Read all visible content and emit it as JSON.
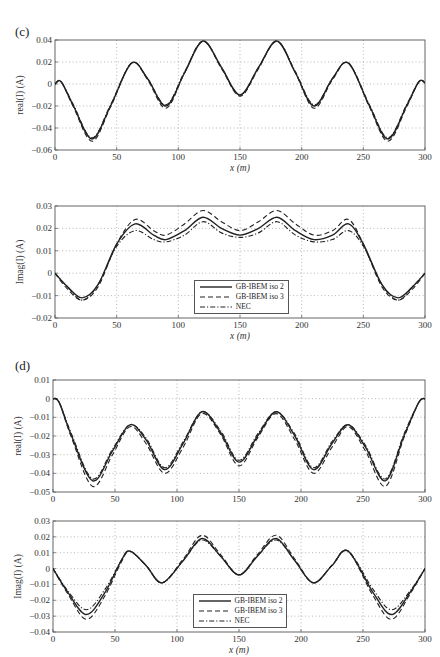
{
  "panels": [
    {
      "label": "(c)"
    },
    {
      "label": "(d)"
    }
  ],
  "legend": {
    "entries": [
      {
        "name": "GB-IBEM iso 2",
        "style": "solid"
      },
      {
        "name": "GB-IBEM iso 3",
        "style": "dashed"
      },
      {
        "name": "NEC",
        "style": "dashdot"
      }
    ]
  },
  "chart_data": [
    {
      "panel": "(c)",
      "type": "line",
      "title": "",
      "xlabel": "x (m)",
      "ylabel": "real(I) (A)",
      "xlim": [
        0,
        300
      ],
      "ylim": [
        -0.06,
        0.04
      ],
      "xticks": [
        "0",
        "50",
        "100",
        "150",
        "200",
        "250",
        "300"
      ],
      "yticks": [
        "0.04",
        "0.02",
        "0",
        "-0.02",
        "-0.04",
        "-0.06"
      ],
      "grid": true,
      "legend_position": "none",
      "x": [
        0,
        5,
        15,
        30,
        45,
        62,
        75,
        90,
        105,
        120,
        135,
        150,
        165,
        180,
        195,
        210,
        225,
        238,
        255,
        270,
        285,
        295,
        300
      ],
      "series": [
        {
          "name": "GB-IBEM iso 2",
          "values": [
            0,
            0.002,
            -0.02,
            -0.05,
            -0.02,
            0.019,
            0.005,
            -0.02,
            0.01,
            0.039,
            0.015,
            -0.01,
            0.015,
            0.039,
            0.01,
            -0.02,
            0.005,
            0.019,
            -0.02,
            -0.05,
            -0.02,
            0.002,
            0.001
          ]
        },
        {
          "name": "GB-IBEM iso 3",
          "values": [
            0,
            0.002,
            -0.021,
            -0.052,
            -0.021,
            0.019,
            0.004,
            -0.022,
            0.01,
            0.039,
            0.014,
            -0.011,
            0.014,
            0.039,
            0.01,
            -0.022,
            0.004,
            0.019,
            -0.021,
            -0.052,
            -0.021,
            0.002,
            0.001
          ]
        },
        {
          "name": "NEC",
          "values": [
            0,
            0.002,
            -0.019,
            -0.049,
            -0.019,
            0.019,
            0.005,
            -0.019,
            0.011,
            0.039,
            0.015,
            -0.01,
            0.015,
            0.039,
            0.011,
            -0.019,
            0.005,
            0.019,
            -0.019,
            -0.049,
            -0.019,
            0.002,
            0.001
          ]
        }
      ]
    },
    {
      "panel": "(c)",
      "type": "line",
      "title": "",
      "xlabel": "x (m)",
      "ylabel": "Imag(I) (A)",
      "xlim": [
        0,
        300
      ],
      "ylim": [
        -0.02,
        0.03
      ],
      "xticks": [
        "0",
        "50",
        "100",
        "150",
        "200",
        "250",
        "300"
      ],
      "yticks": [
        "0.03",
        "0.02",
        "0.01",
        "0",
        "-0.01",
        "-0.02"
      ],
      "grid": true,
      "legend_position": "lower center",
      "x": [
        0,
        10,
        22,
        35,
        50,
        65,
        80,
        90,
        105,
        120,
        135,
        150,
        165,
        180,
        195,
        210,
        225,
        238,
        250,
        265,
        278,
        290,
        300
      ],
      "series": [
        {
          "name": "GB-IBEM iso 2",
          "values": [
            0,
            -0.006,
            -0.011,
            -0.005,
            0.013,
            0.022,
            0.017,
            0.015,
            0.019,
            0.025,
            0.02,
            0.017,
            0.02,
            0.025,
            0.019,
            0.015,
            0.017,
            0.022,
            0.013,
            -0.005,
            -0.011,
            -0.006,
            0
          ]
        },
        {
          "name": "GB-IBEM iso 3",
          "values": [
            0,
            -0.007,
            -0.012,
            -0.006,
            0.013,
            0.024,
            0.019,
            0.017,
            0.022,
            0.028,
            0.023,
            0.019,
            0.023,
            0.028,
            0.022,
            0.017,
            0.019,
            0.024,
            0.013,
            -0.006,
            -0.012,
            -0.007,
            0
          ]
        },
        {
          "name": "NEC",
          "values": [
            0,
            -0.006,
            -0.012,
            -0.005,
            0.012,
            0.019,
            0.015,
            0.014,
            0.017,
            0.023,
            0.018,
            0.016,
            0.018,
            0.023,
            0.017,
            0.014,
            0.015,
            0.019,
            0.012,
            -0.005,
            -0.012,
            -0.006,
            0
          ]
        }
      ]
    },
    {
      "panel": "(d)",
      "type": "line",
      "title": "",
      "xlabel": "",
      "ylabel": "real(I) (A)",
      "xlim": [
        0,
        300
      ],
      "ylim": [
        -0.05,
        0.01
      ],
      "xticks": [
        "0",
        "50",
        "100",
        "150",
        "200",
        "250",
        "300"
      ],
      "yticks": [
        "0.01",
        "0",
        "-0.01",
        "-0.02",
        "-0.03",
        "-0.04",
        "-0.05"
      ],
      "grid": true,
      "legend_position": "none",
      "x": [
        0,
        5,
        15,
        32,
        48,
        62,
        75,
        90,
        105,
        120,
        135,
        150,
        165,
        180,
        195,
        210,
        225,
        238,
        252,
        268,
        283,
        295,
        300
      ],
      "series": [
        {
          "name": "GB-IBEM iso 2",
          "values": [
            0,
            -0.002,
            -0.02,
            -0.044,
            -0.028,
            -0.014,
            -0.022,
            -0.038,
            -0.024,
            -0.007,
            -0.018,
            -0.034,
            -0.02,
            -0.007,
            -0.02,
            -0.038,
            -0.024,
            -0.014,
            -0.026,
            -0.044,
            -0.02,
            -0.002,
            0
          ]
        },
        {
          "name": "GB-IBEM iso 3",
          "values": [
            0,
            -0.002,
            -0.021,
            -0.047,
            -0.03,
            -0.015,
            -0.024,
            -0.04,
            -0.026,
            -0.008,
            -0.019,
            -0.036,
            -0.021,
            -0.008,
            -0.022,
            -0.04,
            -0.026,
            -0.015,
            -0.028,
            -0.047,
            -0.021,
            -0.002,
            0
          ]
        },
        {
          "name": "NEC",
          "values": [
            0,
            -0.002,
            -0.019,
            -0.043,
            -0.027,
            -0.014,
            -0.021,
            -0.037,
            -0.023,
            -0.007,
            -0.017,
            -0.033,
            -0.019,
            -0.007,
            -0.019,
            -0.037,
            -0.023,
            -0.014,
            -0.025,
            -0.043,
            -0.019,
            -0.002,
            0
          ]
        }
      ]
    },
    {
      "panel": "(d)",
      "type": "line",
      "title": "",
      "xlabel": "x (m)",
      "ylabel": "Imag(I) (A)",
      "xlim": [
        0,
        300
      ],
      "ylim": [
        -0.04,
        0.03
      ],
      "xticks": [
        "0",
        "50",
        "100",
        "150",
        "200",
        "250",
        "300"
      ],
      "yticks": [
        "0.03",
        "0.02",
        "0.01",
        "0",
        "-0.01",
        "-0.02",
        "-0.03",
        "-0.04"
      ],
      "grid": true,
      "legend_position": "lower center",
      "x": [
        0,
        12,
        27,
        42,
        55,
        62,
        75,
        88,
        105,
        120,
        135,
        150,
        165,
        180,
        195,
        210,
        225,
        238,
        258,
        273,
        288,
        300
      ],
      "series": [
        {
          "name": "GB-IBEM iso 2",
          "values": [
            0,
            -0.015,
            -0.029,
            -0.015,
            0.005,
            0.011,
            0.002,
            -0.009,
            0.005,
            0.019,
            0.008,
            -0.004,
            0.008,
            0.019,
            0.005,
            -0.009,
            0.002,
            0.011,
            -0.015,
            -0.029,
            -0.015,
            0
          ]
        },
        {
          "name": "GB-IBEM iso 3",
          "values": [
            0,
            -0.016,
            -0.032,
            -0.017,
            0.004,
            0.011,
            0.002,
            -0.009,
            0.006,
            0.021,
            0.009,
            -0.004,
            0.009,
            0.021,
            0.006,
            -0.009,
            0.002,
            0.011,
            -0.017,
            -0.032,
            -0.016,
            0
          ]
        },
        {
          "name": "NEC",
          "values": [
            0,
            -0.014,
            -0.026,
            -0.013,
            0.005,
            0.011,
            0.002,
            -0.009,
            0.005,
            0.018,
            0.008,
            -0.004,
            0.008,
            0.018,
            0.005,
            -0.009,
            0.002,
            0.011,
            -0.013,
            -0.026,
            -0.014,
            0
          ]
        }
      ]
    }
  ]
}
